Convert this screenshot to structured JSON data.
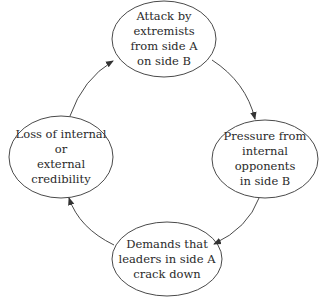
{
  "diagram": {
    "type": "cycle",
    "direction": "clockwise",
    "colors": {
      "stroke": "#4a4a4a",
      "text": "#2a2a2a",
      "background": "#ffffff"
    },
    "nodes": [
      {
        "id": "attack",
        "label": "Attack by extremists\nfrom side A\non side B"
      },
      {
        "id": "pressure",
        "label": "Pressure from\ninternal opponents\nin side B"
      },
      {
        "id": "demands",
        "label": "Demands that\nleaders in side A\ncrack down"
      },
      {
        "id": "loss",
        "label": "Loss of internal or\nexternal credibility"
      }
    ],
    "edges": [
      {
        "from": "attack",
        "to": "pressure"
      },
      {
        "from": "pressure",
        "to": "demands"
      },
      {
        "from": "demands",
        "to": "loss"
      },
      {
        "from": "loss",
        "to": "attack"
      }
    ]
  }
}
